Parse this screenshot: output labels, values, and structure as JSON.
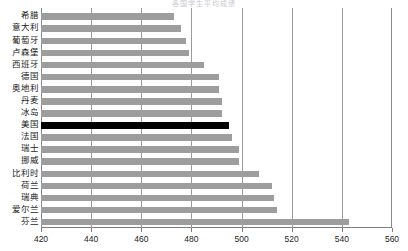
{
  "chart": {
    "title_visible_fragment": "各国学生平均成绩"
  },
  "chart_data": {
    "type": "bar",
    "orientation": "horizontal",
    "xlabel": "",
    "ylabel": "",
    "xlim": [
      420,
      560
    ],
    "xticks": [
      420,
      440,
      460,
      480,
      500,
      520,
      540,
      560
    ],
    "grid": true,
    "legend": "none",
    "highlight_category": "美国",
    "highlight_color": "#000000",
    "bar_color": "#9d9d9d",
    "categories": [
      "希腊",
      "意大利",
      "葡萄牙",
      "卢森堡",
      "西班牙",
      "德国",
      "奥地利",
      "丹麦",
      "冰岛",
      "美国",
      "法国",
      "瑞士",
      "挪威",
      "比利时",
      "荷兰",
      "瑞典",
      "爱尔兰",
      "芬兰"
    ],
    "values": [
      473,
      476,
      478,
      479,
      485,
      491,
      491,
      492,
      492,
      495,
      496,
      499,
      499,
      507,
      512,
      513,
      514,
      543
    ]
  },
  "axis": {
    "tick_labels": [
      "420",
      "440",
      "460",
      "480",
      "500",
      "520",
      "540",
      "560"
    ]
  },
  "rows": [
    {
      "label": "希腊",
      "value": 473
    },
    {
      "label": "意大利",
      "value": 476
    },
    {
      "label": "葡萄牙",
      "value": 478
    },
    {
      "label": "卢森堡",
      "value": 479
    },
    {
      "label": "西班牙",
      "value": 485
    },
    {
      "label": "德国",
      "value": 491
    },
    {
      "label": "奥地利",
      "value": 491
    },
    {
      "label": "丹麦",
      "value": 492
    },
    {
      "label": "冰岛",
      "value": 492
    },
    {
      "label": "美国",
      "value": 495
    },
    {
      "label": "法国",
      "value": 496
    },
    {
      "label": "瑞士",
      "value": 499
    },
    {
      "label": "挪威",
      "value": 499
    },
    {
      "label": "比利时",
      "value": 507
    },
    {
      "label": "荷兰",
      "value": 512
    },
    {
      "label": "瑞典",
      "value": 513
    },
    {
      "label": "爱尔兰",
      "value": 514
    },
    {
      "label": "芬兰",
      "value": 543
    }
  ]
}
